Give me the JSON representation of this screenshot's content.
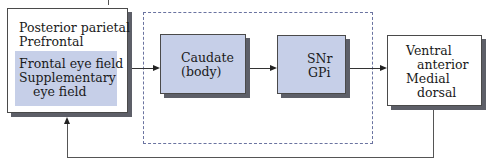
{
  "diagram": {
    "type": "flow",
    "cortex_box": {
      "lines": [
        "Posterior parietal",
        "Prefrontal"
      ],
      "highlight_lines": [
        "Frontal eye field",
        "Supplementary",
        "eye field"
      ]
    },
    "basal_ganglia_group": {
      "caudate_box": {
        "lines": [
          "Caudate",
          "(body)"
        ]
      },
      "output_box": {
        "lines": [
          "SNr",
          "GPi"
        ]
      }
    },
    "thalamus_box": {
      "lines": [
        "Ventral",
        "anterior",
        "Medial",
        "dorsal"
      ]
    },
    "edges": [
      {
        "from": "cortex_box",
        "to": "caudate_box"
      },
      {
        "from": "caudate_box",
        "to": "output_box"
      },
      {
        "from": "output_box",
        "to": "thalamus_box"
      },
      {
        "from": "thalamus_box",
        "to": "cortex_box",
        "style": "feedback-loop"
      }
    ],
    "colors": {
      "box_fill_blue": "#c6cfe8",
      "shadow": "#5d5f68",
      "dashed_border": "#6a73a0",
      "line": "#333333"
    }
  }
}
